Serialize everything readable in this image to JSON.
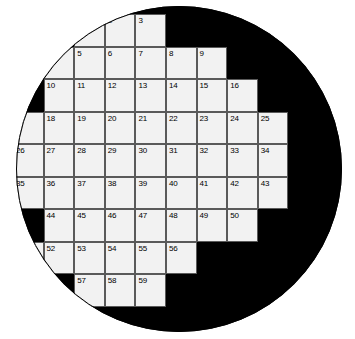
{
  "puzzle": {
    "type": "circular-crossword-grid",
    "shape": "circle",
    "columns": 9,
    "rows": [
      {
        "index": 1,
        "first_col": 3,
        "last_col": 5,
        "numbers": [
          1,
          2,
          3
        ]
      },
      {
        "index": 2,
        "first_col": 2,
        "last_col": 7,
        "numbers": [
          4,
          5,
          6,
          7,
          8,
          9
        ]
      },
      {
        "index": 3,
        "first_col": 2,
        "last_col": 8,
        "numbers": [
          10,
          11,
          12,
          13,
          14,
          15,
          16
        ]
      },
      {
        "index": 4,
        "first_col": 1,
        "last_col": 9,
        "numbers": [
          17,
          18,
          19,
          20,
          21,
          22,
          23,
          24,
          25
        ]
      },
      {
        "index": 5,
        "first_col": 1,
        "last_col": 9,
        "numbers": [
          26,
          27,
          28,
          29,
          30,
          31,
          32,
          33,
          34
        ]
      },
      {
        "index": 6,
        "first_col": 1,
        "last_col": 9,
        "numbers": [
          35,
          36,
          37,
          38,
          39,
          40,
          41,
          42,
          43
        ]
      },
      {
        "index": 7,
        "first_col": 2,
        "last_col": 8,
        "numbers": [
          44,
          45,
          46,
          47,
          48,
          49,
          50
        ]
      },
      {
        "index": 8,
        "first_col": 1,
        "last_col": 7,
        "numbers": [
          51,
          52,
          53,
          54,
          55,
          56
        ]
      },
      {
        "index": 9,
        "first_col": 4,
        "last_col": 6,
        "numbers": [
          57,
          58,
          59
        ]
      }
    ],
    "cell_count": 59,
    "colors": {
      "cell_fill": "#f2f2f2",
      "cell_border": "#5a5a5a",
      "outside_fill": "#000000",
      "page_background": "#ffffff",
      "number_color": "#000000"
    },
    "geometry": {
      "circle_left": 16,
      "circle_top": 6,
      "circle_diameter": 326,
      "col_width": 30.6,
      "row_height": 32.5,
      "grid_left": 13,
      "grid_top": 14
    },
    "cells": [
      {
        "n": "1",
        "col": 3,
        "row": 1
      },
      {
        "n": "2",
        "col": 4,
        "row": 1
      },
      {
        "n": "3",
        "col": 5,
        "row": 1
      },
      {
        "n": "4",
        "col": 2,
        "row": 2
      },
      {
        "n": "5",
        "col": 3,
        "row": 2
      },
      {
        "n": "6",
        "col": 4,
        "row": 2
      },
      {
        "n": "7",
        "col": 5,
        "row": 2
      },
      {
        "n": "8",
        "col": 6,
        "row": 2
      },
      {
        "n": "9",
        "col": 7,
        "row": 2
      },
      {
        "n": "10",
        "col": 2,
        "row": 3
      },
      {
        "n": "11",
        "col": 3,
        "row": 3
      },
      {
        "n": "12",
        "col": 4,
        "row": 3
      },
      {
        "n": "13",
        "col": 5,
        "row": 3
      },
      {
        "n": "14",
        "col": 6,
        "row": 3
      },
      {
        "n": "15",
        "col": 7,
        "row": 3
      },
      {
        "n": "16",
        "col": 8,
        "row": 3
      },
      {
        "n": "17",
        "col": 1,
        "row": 4
      },
      {
        "n": "18",
        "col": 2,
        "row": 4
      },
      {
        "n": "19",
        "col": 3,
        "row": 4
      },
      {
        "n": "20",
        "col": 4,
        "row": 4
      },
      {
        "n": "21",
        "col": 5,
        "row": 4
      },
      {
        "n": "22",
        "col": 6,
        "row": 4
      },
      {
        "n": "23",
        "col": 7,
        "row": 4
      },
      {
        "n": "24",
        "col": 8,
        "row": 4
      },
      {
        "n": "25",
        "col": 9,
        "row": 4
      },
      {
        "n": "26",
        "col": 1,
        "row": 5
      },
      {
        "n": "27",
        "col": 2,
        "row": 5
      },
      {
        "n": "28",
        "col": 3,
        "row": 5
      },
      {
        "n": "29",
        "col": 4,
        "row": 5
      },
      {
        "n": "30",
        "col": 5,
        "row": 5
      },
      {
        "n": "31",
        "col": 6,
        "row": 5
      },
      {
        "n": "32",
        "col": 7,
        "row": 5
      },
      {
        "n": "33",
        "col": 8,
        "row": 5
      },
      {
        "n": "34",
        "col": 9,
        "row": 5
      },
      {
        "n": "35",
        "col": 1,
        "row": 6
      },
      {
        "n": "36",
        "col": 2,
        "row": 6
      },
      {
        "n": "37",
        "col": 3,
        "row": 6
      },
      {
        "n": "38",
        "col": 4,
        "row": 6
      },
      {
        "n": "39",
        "col": 5,
        "row": 6
      },
      {
        "n": "40",
        "col": 6,
        "row": 6
      },
      {
        "n": "41",
        "col": 7,
        "row": 6
      },
      {
        "n": "42",
        "col": 8,
        "row": 6
      },
      {
        "n": "43",
        "col": 9,
        "row": 6
      },
      {
        "n": "44",
        "col": 2,
        "row": 7
      },
      {
        "n": "45",
        "col": 3,
        "row": 7
      },
      {
        "n": "46",
        "col": 4,
        "row": 7
      },
      {
        "n": "47",
        "col": 5,
        "row": 7
      },
      {
        "n": "48",
        "col": 6,
        "row": 7
      },
      {
        "n": "49",
        "col": 7,
        "row": 7
      },
      {
        "n": "50",
        "col": 8,
        "row": 7
      },
      {
        "n": "51",
        "col": 1,
        "row": 8
      },
      {
        "n": "52",
        "col": 2,
        "row": 8
      },
      {
        "n": "53",
        "col": 3,
        "row": 8
      },
      {
        "n": "54",
        "col": 4,
        "row": 8
      },
      {
        "n": "55",
        "col": 5,
        "row": 8
      },
      {
        "n": "56",
        "col": 6,
        "row": 8
      },
      {
        "n": "57",
        "col": 3,
        "row": 9
      },
      {
        "n": "58",
        "col": 4,
        "row": 9
      },
      {
        "n": "59",
        "col": 5,
        "row": 9
      }
    ]
  }
}
